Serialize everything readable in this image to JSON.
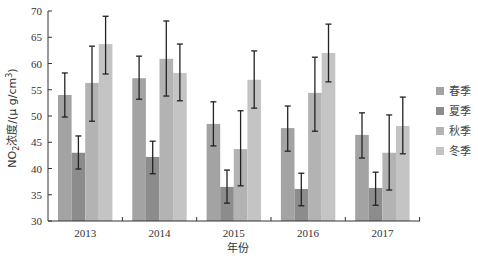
{
  "chart_data": {
    "type": "bar",
    "title": "",
    "xlabel": "年份",
    "ylabel": "NO2浓度/(μg/cm³)",
    "ylabel_parts": {
      "prefix": "NO",
      "sub": "2",
      "mid": "浓度/(μ g/cm",
      "sup": "3",
      "suffix": ")"
    },
    "ylim": [
      30,
      70
    ],
    "yticks": [
      30,
      35,
      40,
      45,
      50,
      55,
      60,
      65,
      70
    ],
    "categories": [
      "2013",
      "2014",
      "2015",
      "2016",
      "2017"
    ],
    "legend_position": "right",
    "grid": false,
    "error_bars": true,
    "series": [
      {
        "name": "春季",
        "color": "#a3a3a3",
        "values": [
          54.0,
          57.2,
          48.5,
          47.7,
          46.4
        ],
        "err_high": [
          58.2,
          61.4,
          52.7,
          51.9,
          50.6
        ],
        "err_low": [
          49.8,
          53.2,
          44.3,
          43.3,
          42.0
        ]
      },
      {
        "name": "夏季",
        "color": "#8c8c8c",
        "values": [
          43.0,
          42.2,
          36.5,
          36.1,
          36.3
        ],
        "err_high": [
          46.2,
          45.2,
          39.7,
          39.1,
          39.3
        ],
        "err_low": [
          39.9,
          39.0,
          33.4,
          32.9,
          33.0
        ]
      },
      {
        "name": "秋季",
        "color": "#b3b3b3",
        "values": [
          56.3,
          60.9,
          43.7,
          54.4,
          43.0
        ],
        "err_high": [
          63.3,
          68.1,
          51.0,
          61.2,
          50.2
        ],
        "err_low": [
          49.0,
          53.8,
          36.7,
          47.1,
          35.9
        ]
      },
      {
        "name": "冬季",
        "color": "#c4c4c4",
        "values": [
          63.7,
          58.2,
          56.9,
          62.0,
          48.1
        ],
        "err_high": [
          69.0,
          63.7,
          62.4,
          67.5,
          53.6
        ],
        "err_low": [
          58.0,
          52.9,
          51.5,
          56.5,
          42.8
        ]
      }
    ]
  }
}
